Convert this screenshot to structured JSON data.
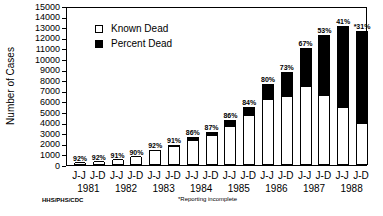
{
  "chart_data": {
    "type": "bar",
    "stacked": true,
    "title": "",
    "xlabel": "",
    "ylabel": "Number of Cases",
    "ylim": [
      0,
      15000
    ],
    "yticks": [
      0,
      1000,
      2000,
      3000,
      4000,
      5000,
      6000,
      7000,
      8000,
      9000,
      10000,
      11000,
      12000,
      13000,
      14000,
      15000
    ],
    "categories": [
      "J-J 1981",
      "J-D 1981",
      "J-J 1982",
      "J-D 1982",
      "J-J 1983",
      "J-D 1983",
      "J-J 1984",
      "J-D 1984",
      "J-J 1985",
      "J-D 1985",
      "J-J 1986",
      "J-D 1986",
      "J-J 1987",
      "J-D 1987",
      "J-J 1988",
      "J-D 1988"
    ],
    "period_labels": [
      "J-J",
      "J-D",
      "J-J",
      "J-D",
      "J-J",
      "J-D",
      "J-J",
      "J-D",
      "J-J",
      "J-D",
      "J-J",
      "J-D",
      "J-J",
      "J-D",
      "J-J",
      "J-D"
    ],
    "years": [
      "1981",
      "1982",
      "1983",
      "1984",
      "1985",
      "1986",
      "1987",
      "1988"
    ],
    "legend": [
      "Known Dead",
      "Percent Dead"
    ],
    "legend_position": "upper-left",
    "series": [
      {
        "name": "Known Dead",
        "color": "#ffffff",
        "values": [
          185,
          275,
          455,
          720,
          1290,
          1730,
          2240,
          2700,
          3600,
          4600,
          6100,
          6400,
          7400,
          6500,
          5400,
          3900
        ]
      },
      {
        "name": "Total Cases",
        "color": "#000000",
        "values": [
          200,
          300,
          500,
          800,
          1400,
          1900,
          2600,
          3100,
          4200,
          5500,
          7600,
          8800,
          11000,
          12300,
          13100,
          12600
        ]
      }
    ],
    "percent_labels": [
      "92%",
      "92%",
      "91%",
      "90%",
      "92%",
      "91%",
      "86%",
      "87%",
      "86%",
      "84%",
      "80%",
      "73%",
      "67%",
      "53%",
      "41%",
      "*31%"
    ],
    "grid": false,
    "source": "HHS/PHS/CDC",
    "footnote": "*Reporting incomplete"
  }
}
